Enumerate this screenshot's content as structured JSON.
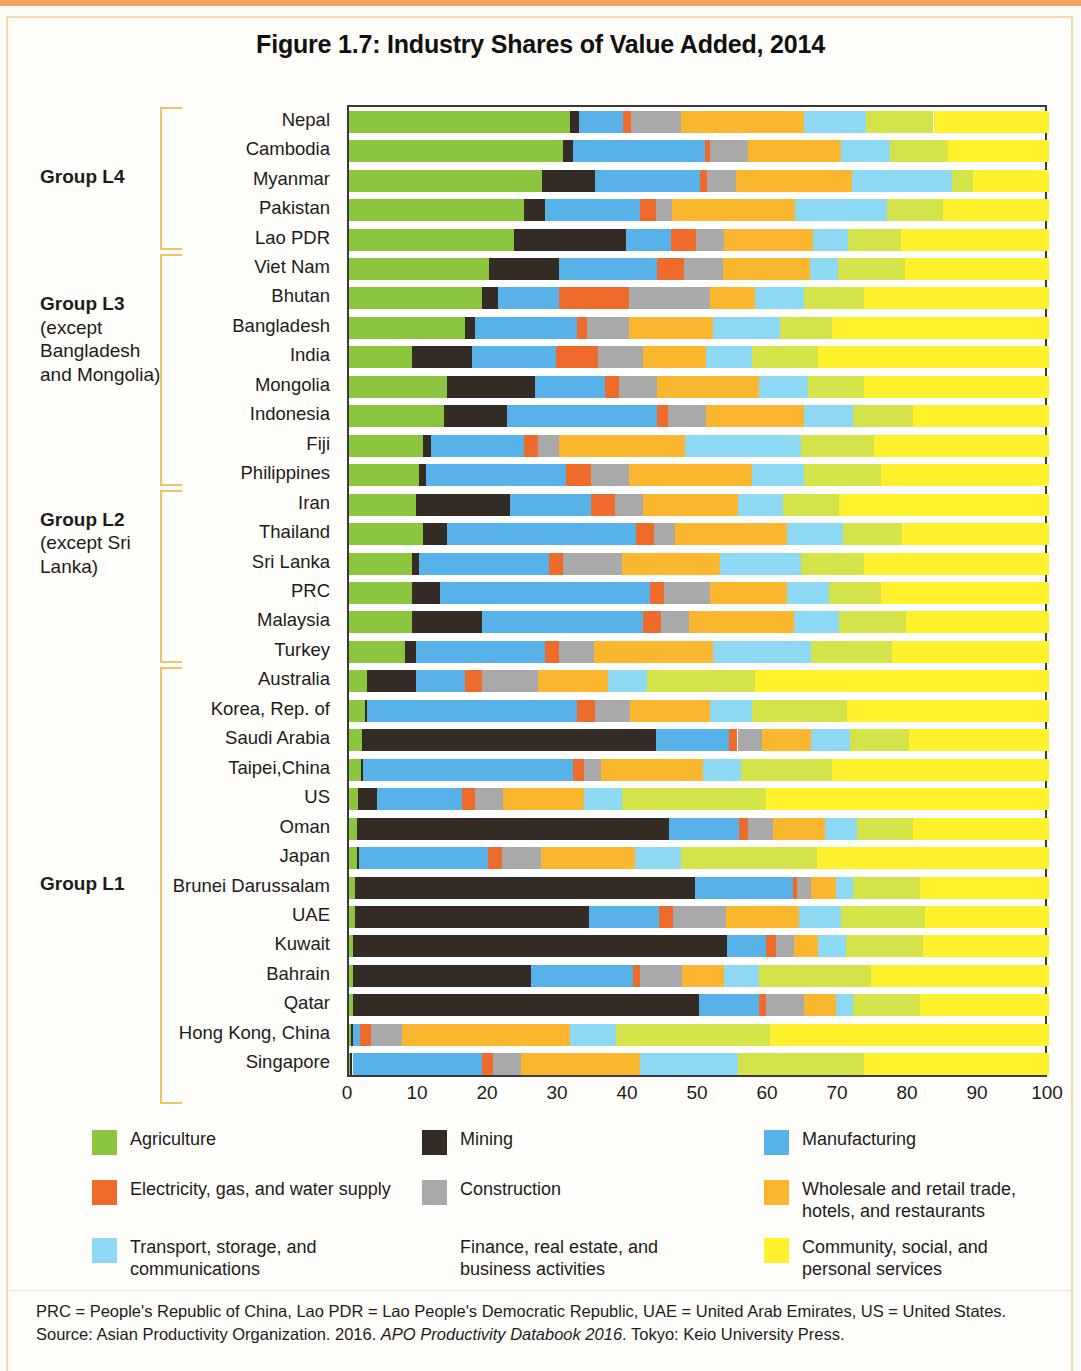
{
  "figure": {
    "title": "Figure 1.7: Industry Shares of Value Added, 2014"
  },
  "groups": [
    {
      "name": "Group L4",
      "note": "",
      "first": 0,
      "last": 4
    },
    {
      "name": "Group L3",
      "note": "(except Bangladesh and Mongolia)",
      "first": 5,
      "last": 12
    },
    {
      "name": "Group L2",
      "note": "(except Sri Lanka)",
      "first": 13,
      "last": 18
    },
    {
      "name": "Group L1",
      "note": "",
      "first": 19,
      "last": 33
    }
  ],
  "legend": {
    "items": [
      {
        "key": "agriculture",
        "label": "Agriculture",
        "color": "#8CC63E"
      },
      {
        "key": "mining",
        "label": "Mining",
        "color": "#332B24"
      },
      {
        "key": "manufacturing",
        "label": "Manufacturing",
        "color": "#56B2E8"
      },
      {
        "key": "electricity",
        "label": "Electricity, gas, and water supply",
        "color": "#EF6B2C"
      },
      {
        "key": "construction",
        "label": "Construction",
        "color": "#A9A9A9"
      },
      {
        "key": "wholesale",
        "label": "Wholesale and retail trade, hotels, and restaurants",
        "color": "#F9B62E"
      },
      {
        "key": "transport",
        "label": "Transport, storage, and communications",
        "color": "#8DD8F2"
      },
      {
        "key": "finance",
        "label": "Finance, real estate, and business activities",
        "color": "#D4E game"
      },
      {
        "key": "community",
        "label": "Community, social, and personal services",
        "color": "#FFF22D"
      }
    ]
  },
  "axis": {
    "ticks": [
      "0",
      "10",
      "20",
      "30",
      "40",
      "50",
      "60",
      "70",
      "80",
      "90",
      "100"
    ],
    "min": 0,
    "max": 100
  },
  "footnote": {
    "line1": "PRC = People's Republic of China, Lao PDR = Lao People's Democratic Republic, UAE = United Arab Emirates, US = United States.",
    "line2_pre": "Source: Asian Productivity Organization. 2016. ",
    "line2_ital": "APO Productivity Databook 2016",
    "line2_post": ". Tokyo: Keio University Press."
  },
  "chart_data": {
    "type": "bar",
    "orientation": "horizontal",
    "stacked": true,
    "normalized": true,
    "title": "Figure 1.7: Industry Shares of Value Added, 2014",
    "xlabel": "",
    "ylabel": "",
    "xlim": [
      0,
      100
    ],
    "grid": false,
    "legend_position": "bottom",
    "series": [
      {
        "name": "Agriculture",
        "color": "#8CC63E"
      },
      {
        "name": "Mining",
        "color": "#332B24"
      },
      {
        "name": "Manufacturing",
        "color": "#56B2E8"
      },
      {
        "name": "Electricity, gas, and water supply",
        "color": "#EF6B2C"
      },
      {
        "name": "Construction",
        "color": "#A9A9A9"
      },
      {
        "name": "Wholesale and retail trade, hotels, and restaurants",
        "color": "#F9B62E"
      },
      {
        "name": "Transport, storage, and communications",
        "color": "#8DD8F2"
      },
      {
        "name": "Finance, real estate, and business activities",
        "color": "#D4E34A"
      },
      {
        "name": "Community, social, and personal services",
        "color": "#FFF22D"
      }
    ],
    "categories": [
      "Nepal",
      "Cambodia",
      "Myanmar",
      "Pakistan",
      "Lao PDR",
      "Viet Nam",
      "Bhutan",
      "Bangladesh",
      "India",
      "Mongolia",
      "Indonesia",
      "Fiji",
      "Philippines",
      "Iran",
      "Thailand",
      "Sri Lanka",
      "PRC",
      "Malaysia",
      "Turkey",
      "Australia",
      "Korea, Rep. of",
      "Saudi Arabia",
      "Taipei,China",
      "US",
      "Oman",
      "Japan",
      "Brunei Darussalam",
      "UAE",
      "Kuwait",
      "Bahrain",
      "Qatar",
      "Hong Kong, China",
      "Singapore"
    ],
    "rows": [
      {
        "country": "Nepal",
        "values": [
          31.5,
          1.3,
          6.3,
          1.2,
          7.1,
          17.6,
          8.9,
          9.6,
          16.5
        ]
      },
      {
        "country": "Cambodia",
        "values": [
          30.5,
          1.5,
          18.8,
          0.8,
          5.4,
          13.3,
          7.0,
          8.3,
          14.4
        ]
      },
      {
        "country": "Myanmar",
        "values": [
          27.5,
          7.6,
          15.0,
          1.0,
          4.2,
          16.6,
          14.2,
          3.0,
          10.9
        ]
      },
      {
        "country": "Pakistan",
        "values": [
          25.0,
          3.0,
          13.5,
          2.3,
          2.4,
          17.5,
          13.2,
          8.0,
          15.1
        ]
      },
      {
        "country": "Lao PDR",
        "values": [
          23.5,
          16.0,
          6.5,
          3.5,
          4.0,
          12.8,
          5.0,
          7.5,
          21.2
        ]
      },
      {
        "country": "Viet Nam",
        "values": [
          20.0,
          10.0,
          14.0,
          3.9,
          5.5,
          12.5,
          4.0,
          9.5,
          20.6
        ]
      },
      {
        "country": "Bhutan",
        "values": [
          19.0,
          2.3,
          8.7,
          10.0,
          11.5,
          6.5,
          7.0,
          8.5,
          26.5
        ]
      },
      {
        "country": "Bangladesh",
        "values": [
          16.5,
          1.5,
          14.5,
          1.5,
          6.0,
          12.0,
          9.5,
          7.5,
          31.0
        ]
      },
      {
        "country": "India",
        "values": [
          9.0,
          8.5,
          12.0,
          6.0,
          6.5,
          9.0,
          6.5,
          9.5,
          33.0
        ]
      },
      {
        "country": "Mongolia",
        "values": [
          14.0,
          12.5,
          10.0,
          2.0,
          5.5,
          14.5,
          7.0,
          8.0,
          26.5
        ]
      },
      {
        "country": "Indonesia",
        "values": [
          13.5,
          9.0,
          21.5,
          1.5,
          5.5,
          14.0,
          7.0,
          8.5,
          19.5
        ]
      },
      {
        "country": "Fiji",
        "values": [
          10.5,
          1.2,
          13.3,
          2.0,
          3.0,
          18.0,
          16.5,
          10.5,
          25.0
        ]
      },
      {
        "country": "Philippines",
        "values": [
          10.0,
          1.0,
          20.0,
          3.5,
          5.5,
          17.5,
          7.5,
          11.0,
          24.0
        ]
      },
      {
        "country": "Iran",
        "values": [
          9.5,
          13.5,
          11.5,
          3.5,
          4.0,
          13.5,
          6.5,
          8.0,
          30.0
        ]
      },
      {
        "country": "Thailand",
        "values": [
          10.5,
          3.5,
          27.0,
          2.5,
          3.0,
          16.0,
          8.0,
          8.5,
          21.0
        ]
      },
      {
        "country": "Sri Lanka",
        "values": [
          9.0,
          1.0,
          18.5,
          2.0,
          8.5,
          14.0,
          11.5,
          9.0,
          26.5
        ]
      },
      {
        "country": "PRC",
        "values": [
          9.0,
          4.0,
          30.0,
          2.0,
          6.5,
          11.0,
          6.0,
          7.5,
          24.0
        ]
      },
      {
        "country": "Malaysia",
        "values": [
          9.0,
          10.0,
          23.0,
          2.5,
          4.0,
          15.0,
          6.5,
          9.5,
          20.5
        ]
      },
      {
        "country": "Turkey",
        "values": [
          8.0,
          1.5,
          18.5,
          2.0,
          5.0,
          17.0,
          14.0,
          11.5,
          22.5
        ]
      },
      {
        "country": "Australia",
        "values": [
          2.5,
          7.0,
          7.0,
          2.5,
          8.0,
          10.0,
          5.5,
          15.5,
          42.0
        ]
      },
      {
        "country": "Korea, Rep. of",
        "values": [
          2.3,
          0.3,
          30.0,
          2.5,
          5.0,
          11.5,
          6.0,
          13.5,
          28.9
        ]
      },
      {
        "country": "Saudi Arabia",
        "values": [
          1.8,
          42.0,
          10.5,
          1.2,
          3.5,
          7.0,
          5.5,
          8.5,
          20.0
        ]
      },
      {
        "country": "Taipei,China",
        "values": [
          1.7,
          0.3,
          30.0,
          1.5,
          2.5,
          14.5,
          5.5,
          13.0,
          31.0
        ]
      },
      {
        "country": "US",
        "values": [
          1.3,
          2.7,
          12.2,
          1.8,
          4.0,
          11.5,
          5.5,
          20.5,
          40.5
        ]
      },
      {
        "country": "Oman",
        "values": [
          1.2,
          44.5,
          10.0,
          1.3,
          3.5,
          7.5,
          4.5,
          8.0,
          19.5
        ]
      },
      {
        "country": "Japan",
        "values": [
          1.2,
          0.2,
          18.5,
          2.0,
          5.5,
          13.5,
          6.5,
          19.5,
          33.1
        ]
      },
      {
        "country": "Brunei Darussalam",
        "values": [
          0.9,
          48.5,
          14.0,
          0.6,
          2.0,
          3.5,
          2.5,
          9.5,
          18.5
        ]
      },
      {
        "country": "UAE",
        "values": [
          0.8,
          33.5,
          10.0,
          2.0,
          7.5,
          10.5,
          6.0,
          12.0,
          17.7
        ]
      },
      {
        "country": "Kuwait",
        "values": [
          0.5,
          53.5,
          5.5,
          1.5,
          2.5,
          3.5,
          4.0,
          11.0,
          18.0
        ]
      },
      {
        "country": "Bahrain",
        "values": [
          0.5,
          25.5,
          14.5,
          1.0,
          6.0,
          6.0,
          5.0,
          16.0,
          25.5
        ]
      },
      {
        "country": "Qatar",
        "values": [
          0.5,
          49.5,
          8.5,
          1.0,
          5.5,
          4.5,
          2.5,
          9.5,
          18.5
        ]
      },
      {
        "country": "Hong Kong, China",
        "values": [
          0.3,
          0.3,
          1.0,
          1.5,
          4.5,
          24.0,
          6.5,
          22.0,
          39.9
        ]
      },
      {
        "country": "Singapore",
        "values": [
          0.2,
          0.3,
          18.5,
          1.5,
          4.0,
          17.0,
          14.0,
          18.0,
          26.5
        ]
      }
    ]
  }
}
